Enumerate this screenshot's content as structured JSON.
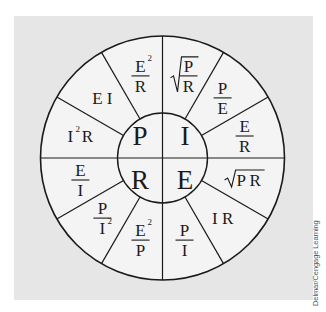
{
  "diagram": {
    "colors": {
      "background_panel": "#e6e6e6",
      "wheel_fill": "#f4f4f4",
      "stroke": "#1a1a1a",
      "text": "#1a1a1a"
    },
    "center": {
      "quadrants": [
        {
          "id": "P",
          "label": "P",
          "meaning": "Power"
        },
        {
          "id": "I",
          "label": "I",
          "meaning": "Current"
        },
        {
          "id": "R",
          "label": "R",
          "meaning": "Resistance"
        },
        {
          "id": "E",
          "label": "E",
          "meaning": "Voltage"
        }
      ]
    },
    "sectors": [
      {
        "quantity": "I",
        "formula": "√(P/R)",
        "kind": "sqrt-frac",
        "num": "P",
        "den": "R"
      },
      {
        "quantity": "I",
        "formula": "P/E",
        "kind": "frac",
        "num": "P",
        "den": "E"
      },
      {
        "quantity": "I",
        "formula": "E/R",
        "kind": "frac",
        "num": "E",
        "den": "R"
      },
      {
        "quantity": "E",
        "formula": "√(PR)",
        "kind": "sqrt",
        "text": "P R"
      },
      {
        "quantity": "E",
        "formula": "I R",
        "kind": "text",
        "text": "I  R"
      },
      {
        "quantity": "E",
        "formula": "P/I",
        "kind": "frac",
        "num": "P",
        "den": "I"
      },
      {
        "quantity": "R",
        "formula": "E²/P",
        "kind": "frac",
        "num": "E",
        "num_sup": "2",
        "den": "P"
      },
      {
        "quantity": "R",
        "formula": "P/I²",
        "kind": "frac",
        "num": "P",
        "den": "I",
        "den_sup": "2"
      },
      {
        "quantity": "R",
        "formula": "E/I",
        "kind": "frac",
        "num": "E",
        "den": "I"
      },
      {
        "quantity": "P",
        "formula": "I²R",
        "kind": "sup-text",
        "base": "I",
        "sup": "2",
        "rest": "R"
      },
      {
        "quantity": "P",
        "formula": "E I",
        "kind": "text",
        "text": "E I"
      },
      {
        "quantity": "P",
        "formula": "E²/R",
        "kind": "frac",
        "num": "E",
        "num_sup": "2",
        "den": "R"
      }
    ]
  },
  "credit": "Delmar/Cengage Learning"
}
